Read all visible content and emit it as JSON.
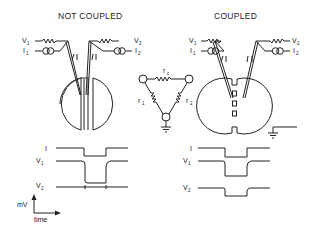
{
  "panels": {
    "left": {
      "title": "NOT COUPLED"
    },
    "right": {
      "title": "COUPLED"
    }
  },
  "labels": {
    "v": "V",
    "i": "I",
    "sub1": "1",
    "sub2": "2",
    "r": "r",
    "sub_c": "c"
  },
  "traces": {
    "left": {
      "rows": [
        "I",
        "V1",
        "V2"
      ]
    },
    "right": {
      "rows": [
        "I",
        "V1",
        "V2"
      ]
    }
  },
  "axes": {
    "y_label": "mV",
    "x_label": "time"
  },
  "circuit": {
    "resistors": [
      "rc",
      "r1",
      "r2"
    ]
  },
  "colors": {
    "ink": "#222222",
    "background": "#ffffff"
  }
}
